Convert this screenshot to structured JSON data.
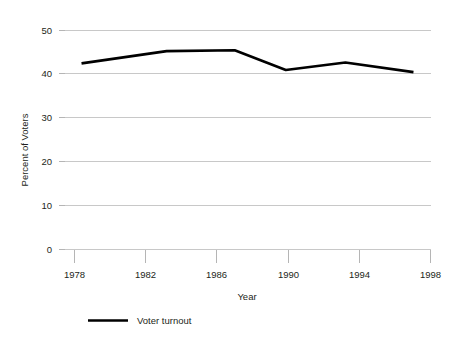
{
  "chart_data": {
    "type": "line",
    "title": "",
    "xlabel": "Year",
    "ylabel": "Percent of Voters",
    "xlim": [
      1977,
      1998.5
    ],
    "ylim": [
      0,
      50
    ],
    "grid": true,
    "legend_position": "bottom-left",
    "x_ticks": [
      "1978",
      "1982",
      "1986",
      "1990",
      "1994",
      "1998"
    ],
    "x_tick_values": [
      1978,
      1982,
      1986,
      1990,
      1994,
      1998
    ],
    "y_ticks": [
      "0",
      "10",
      "20",
      "30",
      "40",
      "50"
    ],
    "y_tick_values": [
      0,
      10,
      20,
      30,
      40,
      50
    ],
    "series": [
      {
        "name": "Voter turnout",
        "color": "#000000",
        "x": [
          1978,
          1983,
          1987,
          1990,
          1993.5,
          1997.5
        ],
        "values": [
          42.5,
          45.3,
          45.5,
          41.0,
          42.7,
          40.5
        ]
      }
    ]
  },
  "legend": {
    "entries": [
      {
        "label": "Voter turnout",
        "color": "#000000"
      }
    ]
  },
  "colors": {
    "series": "#000000",
    "gridline": "#c8c8c8",
    "text": "#231f20",
    "background": "#ffffff"
  }
}
